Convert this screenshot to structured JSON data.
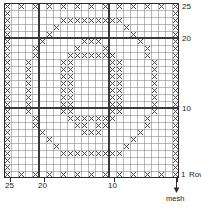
{
  "chart_data": {
    "type": "heatmap",
    "grid": {
      "columns": 25,
      "rows": 25,
      "cell_px": 7.0
    },
    "xlabel": "mesh",
    "ylabel": "Row",
    "xticks": [
      {
        "value": 25,
        "label": "25",
        "col_from_right": 25
      },
      {
        "value": 20,
        "label": "20",
        "col_from_right": 20
      },
      {
        "value": 10,
        "label": "10",
        "col_from_right": 10
      },
      {
        "value": 1,
        "label": "1",
        "col_from_right": 1
      }
    ],
    "yticks": [
      {
        "value": 25,
        "label": "25"
      },
      {
        "value": 20,
        "label": "20"
      },
      {
        "value": 10,
        "label": "10"
      },
      {
        "value": 1,
        "label": "1"
      }
    ],
    "heavy_gridlines": {
      "rows": [
        20,
        10
      ],
      "cols": [
        20,
        10
      ]
    },
    "marked_cells_note": "X = filled (solid) mesh square; blank = open mesh square",
    "rows_filled": [
      {
        "row": 25,
        "cols": [
          1,
          3,
          5,
          7,
          9,
          11,
          13,
          15,
          17,
          19,
          21,
          23,
          25
        ]
      },
      {
        "row": 24,
        "cols": [
          1,
          25
        ]
      },
      {
        "row": 23,
        "cols": [
          1,
          9,
          10,
          11,
          12,
          13,
          14,
          15,
          16,
          17,
          25
        ]
      },
      {
        "row": 22,
        "cols": [
          1,
          8,
          18,
          25
        ]
      },
      {
        "row": 21,
        "cols": [
          1,
          7,
          19,
          25
        ]
      },
      {
        "row": 20,
        "cols": [
          1,
          6,
          12,
          13,
          14,
          20,
          25
        ]
      },
      {
        "row": 19,
        "cols": [
          1,
          5,
          11,
          15,
          21,
          25
        ]
      },
      {
        "row": 18,
        "cols": [
          1,
          5,
          10,
          11,
          12,
          13,
          14,
          15,
          16,
          21,
          25
        ]
      },
      {
        "row": 17,
        "cols": [
          1,
          4,
          9,
          10,
          16,
          17,
          22,
          25
        ]
      },
      {
        "row": 16,
        "cols": [
          1,
          4,
          9,
          10,
          16,
          17,
          22,
          25
        ]
      },
      {
        "row": 15,
        "cols": [
          1,
          4,
          9,
          10,
          16,
          17,
          22,
          25
        ]
      },
      {
        "row": 14,
        "cols": [
          1,
          4,
          9,
          10,
          16,
          17,
          22,
          25
        ]
      },
      {
        "row": 13,
        "cols": [
          1,
          4,
          9,
          10,
          16,
          17,
          22,
          25
        ]
      },
      {
        "row": 12,
        "cols": [
          1,
          4,
          9,
          10,
          16,
          17,
          22,
          25
        ]
      },
      {
        "row": 11,
        "cols": [
          1,
          4,
          9,
          10,
          16,
          17,
          22,
          25
        ]
      },
      {
        "row": 10,
        "cols": [
          1,
          4,
          9,
          10,
          16,
          17,
          22,
          25
        ]
      },
      {
        "row": 9,
        "cols": [
          1,
          5,
          10,
          11,
          12,
          13,
          14,
          15,
          16,
          21,
          25
        ]
      },
      {
        "row": 8,
        "cols": [
          1,
          5,
          11,
          12,
          14,
          15,
          21,
          25
        ]
      },
      {
        "row": 7,
        "cols": [
          1,
          6,
          12,
          13,
          14,
          20,
          25
        ]
      },
      {
        "row": 6,
        "cols": [
          1,
          7,
          19,
          25
        ]
      },
      {
        "row": 5,
        "cols": [
          1,
          8,
          18,
          25
        ]
      },
      {
        "row": 4,
        "cols": [
          1,
          9,
          10,
          11,
          12,
          13,
          14,
          15,
          16,
          17,
          25
        ]
      },
      {
        "row": 3,
        "cols": [
          1,
          25
        ]
      },
      {
        "row": 2,
        "cols": [
          1,
          25
        ]
      },
      {
        "row": 1,
        "cols": [
          1,
          3,
          5,
          7,
          9,
          11,
          13,
          15,
          17,
          19,
          21,
          23,
          25
        ]
      }
    ]
  },
  "axis": {
    "row25": "25",
    "row20": "20",
    "row10": "10",
    "row1": "1",
    "row_word": "Row",
    "col25": "25",
    "col20": "20",
    "col10": "10",
    "mesh": "mesh"
  },
  "colors": {
    "grid_line": "#8c8c8c",
    "heavy_line": "#3a3a3a",
    "border": "#2b2b2b",
    "mark": "#4a4a4a",
    "text": "#1a1a1a",
    "background": "#ffffff"
  }
}
